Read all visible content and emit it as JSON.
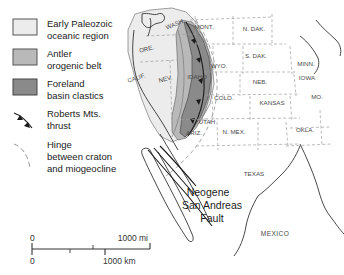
{
  "figure": {
    "background": "#ffffff"
  },
  "legend": {
    "items": [
      {
        "id": "early-paleozoic-oceanic",
        "label_line1": "Early Paleozoic",
        "label_line2": "oceanic region",
        "swatch_fill": "#ececec",
        "swatch_stroke": "#555555",
        "symbol": "filled-rectangle"
      },
      {
        "id": "antler-orogenic-belt",
        "label_line1": "Antler",
        "label_line2": "orogenic belt",
        "swatch_fill": "#b9b9b9",
        "swatch_stroke": "#555555",
        "symbol": "filled-rectangle"
      },
      {
        "id": "foreland-basin-clastics",
        "label_line1": "Foreland",
        "label_line2": "basin clastics",
        "swatch_fill": "#8a8a8a",
        "swatch_stroke": "#444444",
        "symbol": "filled-rectangle"
      },
      {
        "id": "roberts-mts-thrust",
        "label_line1": "Roberts Mts.",
        "label_line2": "thrust",
        "swatch_fill": "none",
        "swatch_stroke": "#1a1a1a",
        "symbol": "thrust-line-with-teeth"
      },
      {
        "id": "hinge-craton-miogeocline",
        "label_line1": "Hinge",
        "label_line2": "between craton",
        "label_line3": "and miogeocline",
        "swatch_fill": "none",
        "swatch_stroke": "#8c8c8c",
        "symbol": "thin-dashed-curve"
      }
    ]
  },
  "map": {
    "states": [
      {
        "abbr": "WASH.",
        "x": 176,
        "y": 26
      },
      {
        "abbr": "ORE.",
        "x": 147,
        "y": 51
      },
      {
        "abbr": "CALIF.",
        "x": 137,
        "y": 80
      },
      {
        "abbr": "NEV.",
        "x": 166,
        "y": 81
      },
      {
        "abbr": "MONT.",
        "x": 204,
        "y": 29
      },
      {
        "abbr": "IDAHO",
        "x": 197,
        "y": 79
      },
      {
        "abbr": "WYO.",
        "x": 219,
        "y": 68
      },
      {
        "abbr": "N. DAK.",
        "x": 254,
        "y": 31
      },
      {
        "abbr": "S. DAK.",
        "x": 256,
        "y": 58
      },
      {
        "abbr": "NEB.",
        "x": 260,
        "y": 84
      },
      {
        "abbr": "MINN.",
        "x": 306,
        "y": 66
      },
      {
        "abbr": "IOWA",
        "x": 307,
        "y": 80
      },
      {
        "abbr": "COLO.",
        "x": 224,
        "y": 100
      },
      {
        "abbr": "KANSAS",
        "x": 272,
        "y": 105
      },
      {
        "abbr": "MO.",
        "x": 317,
        "y": 99
      },
      {
        "abbr": "UTAH",
        "x": 207,
        "y": 124
      },
      {
        "abbr": "ARIZ.",
        "x": 194,
        "y": 135
      },
      {
        "abbr": "N. MEX.",
        "x": 234,
        "y": 134
      },
      {
        "abbr": "OKLA.",
        "x": 305,
        "y": 132
      },
      {
        "abbr": "TEXAS",
        "x": 254,
        "y": 176
      }
    ],
    "countries": [
      {
        "name": "MEXICO",
        "x": 275,
        "y": 236
      }
    ],
    "annotations": [
      {
        "id": "san-andreas-fault",
        "line1": "Neogene",
        "line2": "San Andreas",
        "line3": "Fault",
        "x": 208,
        "y": 196
      }
    ]
  },
  "scale_bar": {
    "miles": {
      "start_label": "0",
      "end_label": "1000 mi"
    },
    "kilometers": {
      "start_label": "0",
      "end_label": "1000 km"
    }
  },
  "colors": {
    "oceanic_region": "#ececec",
    "antler_belt": "#b9b9b9",
    "foreland_basin": "#8a8a8a",
    "state_border": "#9a9a9a",
    "coastline": "#333333",
    "text": "#2b2b2b"
  }
}
